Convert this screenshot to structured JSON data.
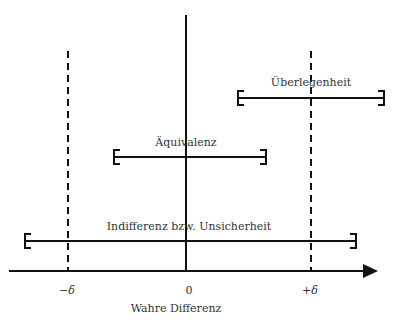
{
  "diagram": {
    "type": "equivalence-margin-diagram",
    "axis": {
      "label": "Wahre Differenz",
      "ticks": [
        {
          "label": "−δ",
          "position": "minus-delta"
        },
        {
          "label": "0",
          "position": "zero"
        },
        {
          "label": "+δ",
          "position": "plus-delta"
        }
      ]
    },
    "intervals": [
      {
        "label": "Überlegenheit",
        "meaning": "entire interval above +δ"
      },
      {
        "label": "Äquivalenz",
        "meaning": "interval within −δ and +δ"
      },
      {
        "label": "Indifferenz bzw. Unsicherheit",
        "meaning": "interval spans beyond both −δ and +δ"
      }
    ],
    "colors": {
      "line": "#111111",
      "text": "#333333",
      "background": "#ffffff"
    }
  }
}
